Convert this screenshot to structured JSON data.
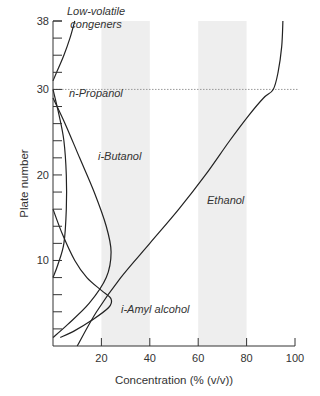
{
  "chart_data": {
    "type": "line",
    "title": "",
    "xlabel": "Concentration (% (v/v))",
    "ylabel": "Plate number",
    "xlim": [
      0,
      100
    ],
    "ylim": [
      0,
      38
    ],
    "x_ticks": [
      20,
      40,
      60,
      80,
      100
    ],
    "y_ticks_labeled": [
      10,
      20,
      30,
      38
    ],
    "y_minor_ticks_every": 2,
    "grid": false,
    "shaded_bands_x": [
      [
        20,
        40
      ],
      [
        60,
        80
      ]
    ],
    "reference_line": {
      "axis": "y",
      "value": 30,
      "style": "dotted"
    },
    "series": [
      {
        "name": "Low-volatile congeners",
        "label_lines": [
          "Low-volatile",
          "congeners"
        ],
        "points": [
          [
            9,
            38
          ],
          [
            7,
            36
          ],
          [
            4.5,
            34
          ],
          [
            1.5,
            32
          ],
          [
            0,
            31
          ]
        ]
      },
      {
        "name": "n-Propanol",
        "label_lines": [
          "n-Propanol"
        ],
        "points": [
          [
            0,
            30
          ],
          [
            2.5,
            27
          ],
          [
            4.5,
            24
          ],
          [
            5.5,
            20
          ],
          [
            5.5,
            16
          ],
          [
            4.5,
            12
          ],
          [
            2,
            9.5
          ],
          [
            0,
            8
          ]
        ]
      },
      {
        "name": "i-Butanol",
        "label_lines": [
          "i-Butanol"
        ],
        "points": [
          [
            0,
            29
          ],
          [
            5,
            26
          ],
          [
            11,
            22
          ],
          [
            17,
            18
          ],
          [
            22,
            14
          ],
          [
            24,
            11
          ],
          [
            22,
            8
          ],
          [
            15,
            5
          ],
          [
            6,
            2.5
          ],
          [
            0,
            1
          ]
        ]
      },
      {
        "name": "i-Amyl alcohol",
        "label_lines": [
          "i-Amyl alcohol"
        ],
        "points": [
          [
            0,
            16
          ],
          [
            4,
            13
          ],
          [
            9,
            10
          ],
          [
            14,
            8
          ],
          [
            20,
            6.5
          ],
          [
            24,
            5.5
          ],
          [
            23,
            4.5
          ],
          [
            16,
            3
          ],
          [
            9,
            1.8
          ],
          [
            3,
            1
          ]
        ]
      },
      {
        "name": "Ethanol",
        "label_lines": [
          "Ethanol"
        ],
        "points": [
          [
            10,
            0
          ],
          [
            18,
            4
          ],
          [
            28,
            8
          ],
          [
            40,
            12
          ],
          [
            52,
            16
          ],
          [
            63,
            20
          ],
          [
            73,
            24
          ],
          [
            81,
            27
          ],
          [
            87,
            29
          ],
          [
            91,
            30
          ],
          [
            93,
            32
          ],
          [
            94.5,
            35
          ],
          [
            95,
            38
          ]
        ]
      }
    ]
  }
}
